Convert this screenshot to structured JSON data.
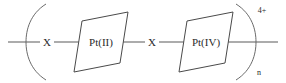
{
  "figure": {
    "background_color": "#ffffff",
    "line_color": "#4a4a4a",
    "text_color": "#2b2b2b"
  },
  "structure": {
    "type": "chemical-structure",
    "repeat_unit_charge": "4+",
    "repeat_subscript": "n",
    "metal_centers": [
      {
        "label": "Pt(II)",
        "oxidation_state": "II",
        "geometry": "square-planar"
      },
      {
        "label": "Pt(IV)",
        "oxidation_state": "IV",
        "geometry": "octahedral"
      }
    ],
    "bridging_ligands": [
      {
        "label": "X"
      },
      {
        "label": "X"
      }
    ],
    "brackets": {
      "left": "(",
      "right": ")"
    }
  }
}
